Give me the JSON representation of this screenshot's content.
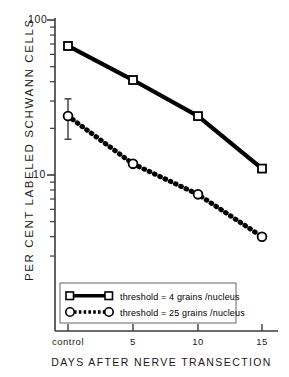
{
  "chart_data": {
    "type": "line",
    "title": "",
    "xlabel": "DAYS AFTER NERVE TRANSECTION",
    "ylabel": "PER CENT LABELED SCHWANN CELLS",
    "yscale": "log",
    "ylim": [
      2.5,
      100
    ],
    "y_major_ticks": [
      10,
      100
    ],
    "y_major_tick_labels": [
      "10",
      "100"
    ],
    "grid": false,
    "legend_position": "bottom-left",
    "categories": [
      "control",
      "5",
      "10",
      "15"
    ],
    "x_tick_labels": [
      "control",
      "5",
      "10",
      "15"
    ],
    "series": [
      {
        "name": "threshold = 4 grains /nucleus",
        "marker": "open-square",
        "linestyle": "solid",
        "color": "#000000",
        "values": [
          68,
          41,
          24,
          11
        ],
        "errors": [
          4,
          0,
          0,
          0
        ]
      },
      {
        "name": "threshold = 25 grains /nucleus",
        "marker": "open-circle",
        "linestyle": "dotted",
        "color": "#000000",
        "values": [
          24,
          11.8,
          7.5,
          4.0
        ],
        "errors": [
          7,
          0,
          0,
          0
        ]
      }
    ]
  },
  "axes": {
    "y_label": "PER CENT  LABELED  SCHWANN  CELLS",
    "x_label": "DAYS AFTER  NERVE  TRANSECTION",
    "y_tick_top": "100",
    "y_tick_bottom": "10",
    "x_ticks": [
      "control",
      "5",
      "10",
      "15"
    ]
  },
  "legend": {
    "entries": [
      {
        "label": "threshold = 4 grains /nucleus",
        "marker": "open-square",
        "line": "solid"
      },
      {
        "label": "threshold = 25 grains /nucleus",
        "marker": "open-circle",
        "line": "dotted"
      }
    ]
  },
  "colors": {
    "ink": "#000000",
    "background": "#ffffff"
  }
}
